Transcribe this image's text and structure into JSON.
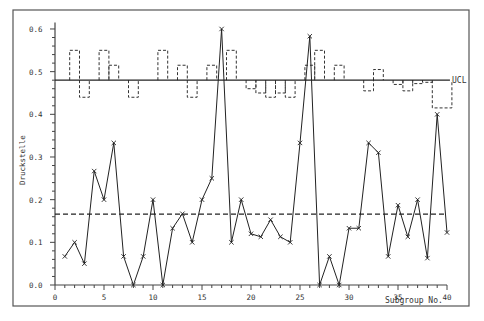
{
  "chart_data": {
    "type": "line",
    "title": "",
    "xlabel": "Subgroup No.",
    "ylabel": "Druckstelle",
    "xlim": [
      0,
      40
    ],
    "ylim": [
      0.0,
      0.62
    ],
    "x_ticks": [
      0,
      5,
      10,
      15,
      20,
      25,
      30,
      35,
      40
    ],
    "x_tick_labels": [
      "0",
      "5",
      "10",
      "15",
      "20",
      "25",
      "30",
      "35",
      "40"
    ],
    "y_ticks": [
      0.0,
      0.1,
      0.2,
      0.3,
      0.4,
      0.5,
      0.6
    ],
    "y_tick_labels": [
      "0.0",
      "0.1",
      "0.2",
      "0.3",
      "0.4",
      "0.5",
      "0.6"
    ],
    "grid": false,
    "legend": null,
    "annotations": [
      {
        "text": "UCL",
        "y": 0.48
      }
    ],
    "control_lines": {
      "ucl": 0.48,
      "center_line": 0.166
    },
    "x": [
      1,
      2,
      3,
      4,
      5,
      6,
      7,
      8,
      9,
      10,
      11,
      12,
      13,
      14,
      15,
      16,
      17,
      18,
      19,
      20,
      21,
      22,
      23,
      24,
      25,
      26,
      27,
      28,
      29,
      30,
      31,
      32,
      33,
      34,
      35,
      36,
      37,
      38,
      39,
      40
    ],
    "series": [
      {
        "name": "proportion",
        "style": "solid line with x markers",
        "values": [
          0.067,
          0.1,
          0.05,
          0.267,
          0.2,
          0.333,
          0.067,
          0.0,
          0.067,
          0.2,
          0.0,
          0.133,
          0.167,
          0.1,
          0.2,
          0.25,
          0.6,
          0.1,
          0.2,
          0.12,
          0.113,
          0.153,
          0.113,
          0.1,
          0.333,
          0.583,
          0.0,
          0.067,
          0.0,
          0.133,
          0.133,
          0.333,
          0.31,
          0.067,
          0.187,
          0.113,
          0.2,
          0.063,
          0.4,
          0.123
        ]
      },
      {
        "name": "variable UCL steps",
        "style": "dashed step, drawn only where differs from UCL",
        "steps": [
          {
            "from": 1.5,
            "to": 2.5,
            "y": 0.55
          },
          {
            "from": 2.5,
            "to": 3.5,
            "y": 0.44
          },
          {
            "from": 4.5,
            "to": 5.5,
            "y": 0.55
          },
          {
            "from": 5.5,
            "to": 6.5,
            "y": 0.515
          },
          {
            "from": 7.5,
            "to": 8.5,
            "y": 0.44
          },
          {
            "from": 10.5,
            "to": 11.5,
            "y": 0.55
          },
          {
            "from": 12.5,
            "to": 13.5,
            "y": 0.515
          },
          {
            "from": 13.5,
            "to": 14.5,
            "y": 0.44
          },
          {
            "from": 15.5,
            "to": 16.5,
            "y": 0.515
          },
          {
            "from": 17.5,
            "to": 18.5,
            "y": 0.55
          },
          {
            "from": 19.5,
            "to": 20.5,
            "y": 0.46
          },
          {
            "from": 20.5,
            "to": 21.5,
            "y": 0.45
          },
          {
            "from": 21.5,
            "to": 22.5,
            "y": 0.44
          },
          {
            "from": 22.5,
            "to": 23.5,
            "y": 0.45
          },
          {
            "from": 23.5,
            "to": 24.5,
            "y": 0.44
          },
          {
            "from": 25.5,
            "to": 26.5,
            "y": 0.515
          },
          {
            "from": 26.5,
            "to": 27.5,
            "y": 0.55
          },
          {
            "from": 28.5,
            "to": 29.5,
            "y": 0.515
          },
          {
            "from": 31.5,
            "to": 32.5,
            "y": 0.455
          },
          {
            "from": 32.5,
            "to": 33.5,
            "y": 0.505
          },
          {
            "from": 34.5,
            "to": 35.5,
            "y": 0.47
          },
          {
            "from": 35.5,
            "to": 36.5,
            "y": 0.455
          },
          {
            "from": 36.5,
            "to": 37.5,
            "y": 0.472
          },
          {
            "from": 37.5,
            "to": 38.5,
            "y": 0.475
          },
          {
            "from": 38.5,
            "to": 40.5,
            "y": 0.415
          }
        ]
      }
    ]
  },
  "labels": {
    "ucl": "UCL",
    "xlabel": "Subgroup No.",
    "ylabel": "Druckstelle"
  }
}
